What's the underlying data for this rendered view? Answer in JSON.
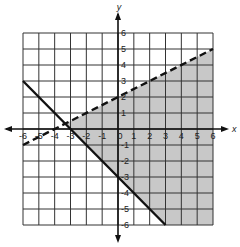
{
  "chart_data": {
    "type": "line",
    "title": "",
    "xlabel": "x",
    "ylabel": "y",
    "xlim": [
      -6,
      6
    ],
    "ylim": [
      -6,
      6
    ],
    "grid": true,
    "x_ticks": [
      "-6",
      "-5",
      "-4",
      "-3",
      "-2",
      "-1",
      "0",
      "1",
      "2",
      "3",
      "4",
      "5",
      "6"
    ],
    "y_ticks": [
      "6",
      "5",
      "4",
      "3",
      "2",
      "1",
      "-1",
      "-2",
      "-3",
      "-4",
      "-5",
      "-6"
    ],
    "series": [
      {
        "name": "dashed boundary",
        "style": "dashed",
        "slope": 0.5,
        "intercept": 2,
        "x": [
          -6,
          6
        ],
        "y": [
          -1,
          5
        ]
      },
      {
        "name": "solid boundary",
        "style": "solid",
        "slope": -1,
        "intercept": -3,
        "x": [
          -6,
          3
        ],
        "y": [
          3,
          -6
        ]
      }
    ],
    "shaded_region": "y < 0.5x + 2 and y >= -x - 3",
    "colors": {
      "shade": "#c8c8c8",
      "grid": "#333333",
      "line": "#111111"
    }
  }
}
